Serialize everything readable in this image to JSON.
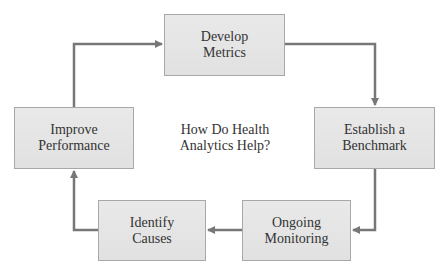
{
  "diagram": {
    "title": "How Do Health Analytics Help?",
    "center": {
      "line1": "How Do Health",
      "line2": "Analytics Help?"
    },
    "steps": [
      {
        "id": "develop-metrics",
        "line1": "Develop",
        "line2": "Metrics"
      },
      {
        "id": "establish-benchmark",
        "line1": "Establish a",
        "line2": "Benchmark"
      },
      {
        "id": "ongoing-monitoring",
        "line1": "Ongoing",
        "line2": "Monitoring"
      },
      {
        "id": "identify-causes",
        "line1": "Identify",
        "line2": "Causes"
      },
      {
        "id": "improve-performance",
        "line1": "Improve",
        "line2": "Performance"
      }
    ],
    "flow": [
      "Develop Metrics",
      "Establish a Benchmark",
      "Ongoing Monitoring",
      "Identify Causes",
      "Improve Performance",
      "Develop Metrics"
    ],
    "colors": {
      "box_fill": "#e5e5e5",
      "box_border": "#a8a8a8",
      "arrow": "#777777",
      "text": "#333333"
    }
  }
}
